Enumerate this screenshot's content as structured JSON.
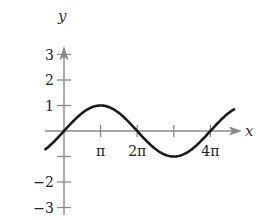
{
  "chart_data": {
    "type": "line",
    "title": "",
    "function": "y = sin(x/2)",
    "xlabel": "x",
    "ylabel": "y",
    "x_ticks": [
      {
        "value": 3.14159,
        "label": "π"
      },
      {
        "value": 6.28319,
        "label": "2π"
      },
      {
        "value": 9.42478,
        "label": ""
      },
      {
        "value": 12.56637,
        "label": "4π"
      }
    ],
    "y_ticks": [
      {
        "value": 3,
        "label": "3"
      },
      {
        "value": 2,
        "label": "2"
      },
      {
        "value": 1,
        "label": "1"
      },
      {
        "value": -1,
        "label": ""
      },
      {
        "value": -2,
        "label": "−2"
      },
      {
        "value": -3,
        "label": "−3"
      }
    ],
    "xlim": [
      -1.6,
      14.6
    ],
    "ylim": [
      -3.3,
      3.5
    ],
    "x_range_curve": [
      -1.6,
      14.6
    ],
    "series": [
      {
        "name": "curve",
        "points": [
          [
            -1.57,
            -0.71
          ],
          [
            0,
            0
          ],
          [
            1.57,
            0.71
          ],
          [
            3.14,
            1
          ],
          [
            4.71,
            0.71
          ],
          [
            6.28,
            0
          ],
          [
            7.85,
            -0.71
          ],
          [
            9.42,
            -1
          ],
          [
            11.0,
            -0.71
          ],
          [
            12.57,
            0
          ],
          [
            14.14,
            0.71
          ]
        ]
      }
    ],
    "grid": false,
    "legend": null
  },
  "axes": {
    "x_label": "x",
    "y_label": "y"
  }
}
